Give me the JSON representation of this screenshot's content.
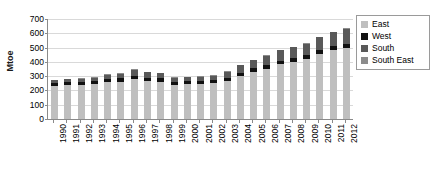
{
  "chart_data": {
    "type": "bar",
    "stacked": true,
    "title": "",
    "xlabel": "",
    "ylabel": "Mtoe",
    "ylim": [
      0,
      700
    ],
    "ytick_step": 100,
    "yticks": [
      700,
      600,
      500,
      400,
      300,
      200,
      100,
      0
    ],
    "grid": true,
    "legend_position": "top-right",
    "categories": [
      "1990",
      "1991",
      "1992",
      "1993",
      "1994",
      "1995",
      "1996",
      "1997",
      "1998",
      "1999",
      "2000",
      "2001",
      "2002",
      "2003",
      "2004",
      "2005",
      "2006",
      "2007",
      "2008",
      "2009",
      "2010",
      "2011",
      "2012"
    ],
    "series": [
      {
        "name": "East",
        "color": "#bfbfbf",
        "values": [
          232,
          238,
          240,
          244,
          258,
          262,
          280,
          268,
          262,
          240,
          244,
          246,
          252,
          268,
          300,
          330,
          352,
          382,
          398,
          420,
          452,
          480,
          500
        ]
      },
      {
        "name": "West",
        "color": "#111111",
        "values": [
          20,
          20,
          20,
          20,
          22,
          22,
          24,
          22,
          22,
          20,
          20,
          20,
          20,
          22,
          24,
          24,
          26,
          26,
          26,
          26,
          28,
          28,
          28
        ]
      },
      {
        "name": "South",
        "color": "#595959",
        "values": [
          18,
          20,
          22,
          24,
          30,
          34,
          42,
          38,
          36,
          28,
          28,
          30,
          32,
          40,
          52,
          58,
          66,
          72,
          78,
          82,
          92,
          100,
          104
        ]
      },
      {
        "name": "South East",
        "color": "#8c8c8c",
        "values": [
          4,
          4,
          4,
          4,
          4,
          4,
          6,
          4,
          4,
          4,
          4,
          4,
          4,
          4,
          4,
          4,
          4,
          4,
          4,
          4,
          4,
          4,
          4
        ]
      }
    ],
    "totals": [
      274,
      282,
      286,
      292,
      314,
      322,
      352,
      332,
      324,
      292,
      296,
      300,
      308,
      334,
      380,
      416,
      448,
      484,
      506,
      532,
      576,
      612,
      636
    ]
  },
  "legend": {
    "items": [
      {
        "label": "East",
        "color": "#bfbfbf"
      },
      {
        "label": "West",
        "color": "#111111"
      },
      {
        "label": "South",
        "color": "#595959"
      },
      {
        "label": "South East",
        "color": "#8c8c8c"
      }
    ]
  },
  "axis": {
    "y_title": "Mtoe"
  }
}
